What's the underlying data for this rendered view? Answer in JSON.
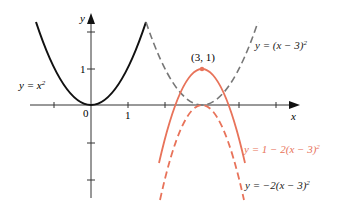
{
  "diagram": {
    "axes": {
      "x_label": "x",
      "y_label": "y",
      "x_ticks": [
        {
          "value": "0",
          "label": "0"
        },
        {
          "value": "1",
          "label": "1"
        }
      ],
      "y_ticks": [
        {
          "value": "1",
          "label": "1"
        }
      ]
    },
    "point": {
      "label": "(3, 1)"
    },
    "curves": [
      {
        "id": "base",
        "label_prefix": "y = x",
        "exp": "2",
        "style": "solid",
        "color": "#111111"
      },
      {
        "id": "shifted",
        "label_prefix": "y = (x − 3)",
        "exp": "2",
        "style": "dashed",
        "color": "#777777"
      },
      {
        "id": "reflected_raised",
        "label_prefix": "y = 1 − 2(x − 3)",
        "exp": "2",
        "style": "solid",
        "color": "#e8735a"
      },
      {
        "id": "reflected",
        "label_prefix": "y = −2(x − 3)",
        "exp": "2",
        "style": "dashed",
        "color": "#e8735a"
      }
    ]
  }
}
